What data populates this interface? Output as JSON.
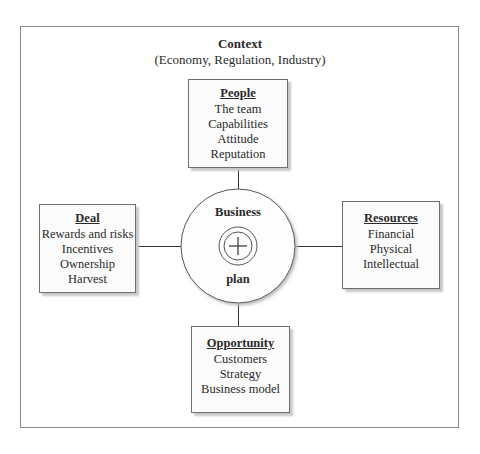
{
  "context": {
    "title": "Context",
    "subtitle": "(Economy, Regulation, Industry)"
  },
  "center": {
    "top_label": "Business",
    "bottom_label": "plan",
    "icon": "crosshair-plus-icon"
  },
  "boxes": {
    "people": {
      "heading": "People",
      "items": [
        "The team",
        "Capabilities",
        "Attitude",
        "Reputation"
      ]
    },
    "deal": {
      "heading": "Deal",
      "items": [
        "Rewards and risks",
        "Incentives",
        "Ownership",
        "Harvest"
      ]
    },
    "resources": {
      "heading": "Resources",
      "items": [
        "Financial",
        "Physical",
        "Intellectual"
      ]
    },
    "opportunity": {
      "heading": "Opportunity",
      "items": [
        "Customers",
        "Strategy",
        "Business model"
      ]
    }
  },
  "colors": {
    "stroke": "#333333",
    "box_border": "#6e6e6e",
    "shadow": "#c8c8c8"
  }
}
